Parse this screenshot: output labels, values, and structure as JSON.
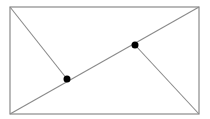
{
  "diagram": {
    "type": "geometry",
    "stroke_color": "#8a8a8a",
    "point_color": "#000000",
    "rectangle": {
      "x1": 10,
      "y1": 7,
      "x2": 199,
      "y2": 114
    },
    "diagonal": {
      "from": [
        10,
        114
      ],
      "to": [
        199,
        7
      ]
    },
    "perpendiculars": [
      {
        "from": [
          10,
          7
        ],
        "to": [
          67,
          79
        ]
      },
      {
        "from": [
          199,
          114
        ],
        "to": [
          135,
          45
        ]
      }
    ],
    "points": [
      {
        "x": 67,
        "y": 79,
        "r": 3.5
      },
      {
        "x": 135,
        "y": 45,
        "r": 3.5
      }
    ]
  }
}
